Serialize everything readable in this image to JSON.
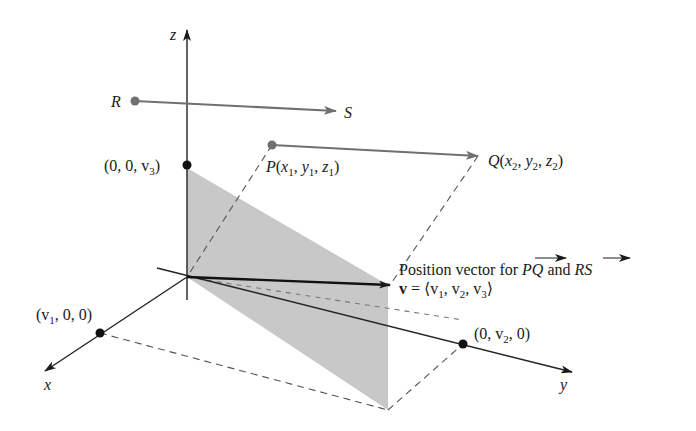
{
  "diagram": {
    "axes": {
      "x_label": "x",
      "y_label": "y",
      "z_label": "z"
    },
    "points": {
      "R": "R",
      "S": "S",
      "P": {
        "name": "P",
        "x": "x",
        "y": "y",
        "z": "z",
        "sub": "1"
      },
      "Q": {
        "name": "Q",
        "x": "x",
        "y": "y",
        "z": "z",
        "sub": "2"
      },
      "z_intercept": {
        "label": "(0, 0, v",
        "sub": "3",
        "close": ")"
      },
      "x_intercept": {
        "label": "(v",
        "sub": "1",
        "rest": ", 0, 0)"
      },
      "y_intercept": {
        "open": "(0, v",
        "sub": "2",
        "rest": ", 0)"
      }
    },
    "annotation": {
      "line1_prefix": "Position vector for ",
      "vec1": "PQ",
      "and": " and ",
      "vec2": "RS",
      "v_symbol": "v",
      "v_equals": " = ⟨v",
      "v1_sub": "1",
      "v2": ", v",
      "v2_sub": "2",
      "v3": ", v",
      "v3_sub": "3",
      "close": "⟩"
    },
    "colors": {
      "axis": "#222222",
      "vector_gray": "#707070",
      "position_vector": "#111111",
      "shade": "#c8c8c8",
      "dashed": "#555555"
    }
  }
}
